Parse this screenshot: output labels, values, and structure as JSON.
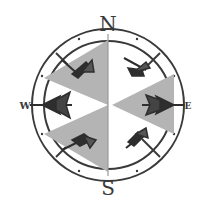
{
  "compass": {
    "labels": {
      "north": "N",
      "south": "S",
      "east": "E",
      "west": "W"
    },
    "colors": {
      "ring": "#3a3a3a",
      "star_fill": "#b4b4b4",
      "arrow": "#2e2e2e",
      "background": "#ffffff"
    },
    "icons": [
      "compass-rose-icon",
      "arrow-icon"
    ]
  }
}
